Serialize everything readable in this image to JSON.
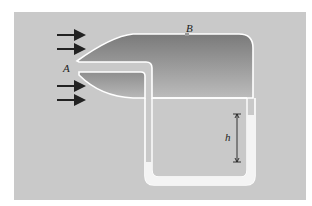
{
  "figure": {
    "type": "pitot-tube-manometer",
    "labels": {
      "inlet": "A",
      "side_opening": "B",
      "height_difference": "h"
    },
    "flow_arrows": 4,
    "colors": {
      "background": "#ffffff",
      "panel": "#c9c9c9",
      "body_dark": "#7e7e7e",
      "body_light": "#bdbdbd",
      "tube_outline": "#ffffff",
      "manometer_liquid": "#f4f4f4",
      "arrow": "#222222"
    }
  }
}
